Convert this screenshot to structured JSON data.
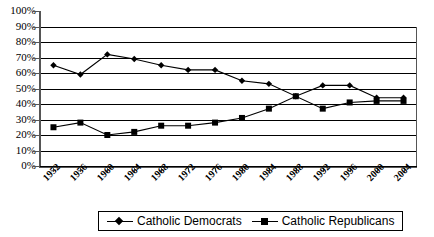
{
  "chart_data": {
    "type": "line",
    "title": "",
    "xlabel": "",
    "ylabel": "",
    "ylim": [
      0,
      100
    ],
    "ytick_labels": [
      "100%",
      "90%",
      "80%",
      "70%",
      "60%",
      "50%",
      "40%",
      "30%",
      "20%",
      "10%",
      "0%"
    ],
    "ytick_values": [
      100,
      90,
      80,
      70,
      60,
      50,
      40,
      30,
      20,
      10,
      0
    ],
    "grid": "horizontal",
    "legend_position": "bottom",
    "categories": [
      "1952",
      "1956",
      "1960",
      "1964",
      "1968",
      "1972",
      "1976",
      "1980",
      "1984",
      "1988",
      "1992",
      "1996",
      "2000",
      "2004"
    ],
    "series": [
      {
        "name": "Catholic Democrats",
        "marker": "diamond",
        "color": "#000000",
        "values": [
          65,
          59,
          72,
          69,
          65,
          62,
          62,
          55,
          53,
          45,
          52,
          52,
          44,
          44
        ]
      },
      {
        "name": "Catholic Republicans",
        "marker": "square",
        "color": "#000000",
        "values": [
          25,
          28,
          20,
          22,
          26,
          26,
          28,
          31,
          37,
          45,
          37,
          41,
          42,
          42
        ]
      }
    ]
  },
  "legend": {
    "items": [
      {
        "label": "Catholic Democrats",
        "marker": "diamond-marker"
      },
      {
        "label": "Catholic Republicans",
        "marker": "square-marker"
      }
    ]
  }
}
